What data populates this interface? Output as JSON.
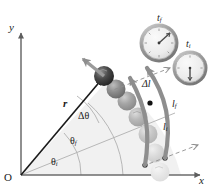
{
  "figure": {
    "type": "physics-diagram",
    "background_color": "#ffffff"
  },
  "axes": {
    "y_label": "y",
    "x_label": "x",
    "origin_label": "O",
    "axis_color": "#6b6b6b"
  },
  "vectors": {
    "radius_label": "r",
    "radius_color": "#1b1b1b",
    "velocity_arrow_name": "velocity-arrow",
    "velocity_arrow_color": "#9a9a9a"
  },
  "angles": {
    "initial": "θ",
    "initial_sub": "i",
    "final": "θ",
    "final_sub": "f",
    "delta": "Δθ",
    "sector_fill": "#eeeeee",
    "sector_stroke": "#b4b4b4"
  },
  "arcs": {
    "inner_label": "l",
    "inner_sub": "i",
    "outer_label": "l",
    "outer_sub": "f",
    "delta_label": "Δl",
    "arc_color": "#8e8e8e"
  },
  "clocks": [
    {
      "name": "clock-final",
      "label": "t",
      "label_sub": "f",
      "hand_angle_deg": 55,
      "cx": 159,
      "cy": 43,
      "r": 19
    },
    {
      "name": "clock-initial",
      "label": "t",
      "label_sub": "i",
      "hand_angle_deg": 180,
      "cx": 190,
      "cy": 68,
      "r": 17
    }
  ],
  "spheres": {
    "count": 7,
    "lead_color": "#3a3a3a",
    "fade_note": "dark-to-light trail"
  },
  "markers": {
    "dot_color": "#111111",
    "dashed_color": "#8e8e8e"
  }
}
